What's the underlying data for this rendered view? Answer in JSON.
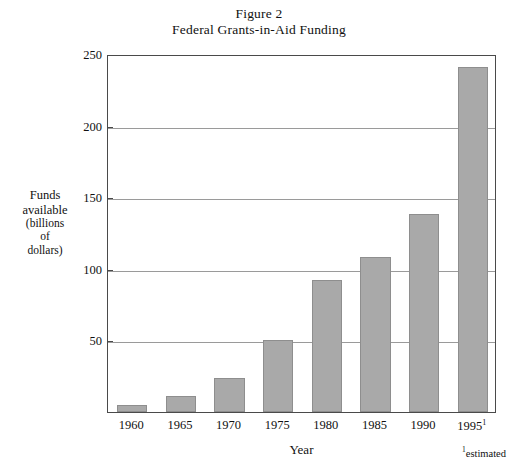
{
  "chart_data": {
    "type": "bar",
    "title": "Figure 2",
    "subtitle": "Federal Grants-in-Aid Funding",
    "categories": [
      "1960",
      "1965",
      "1970",
      "1975",
      "1980",
      "1985",
      "1990",
      "1995"
    ],
    "category_labels": [
      "1960",
      "1965",
      "1970",
      "1975",
      "1980",
      "1985",
      "1990",
      "1995¹"
    ],
    "values": [
      5,
      11,
      24,
      50,
      92,
      108,
      138,
      241
    ],
    "series": [
      {
        "name": "Funds available (billions of dollars)",
        "values": [
          5,
          11,
          24,
          50,
          92,
          108,
          138,
          241
        ]
      }
    ],
    "xlabel": "Year",
    "ylabel": "Funds available (billions of dollars)",
    "ylim": [
      0,
      250
    ],
    "yticks": [
      50,
      100,
      150,
      200,
      250
    ],
    "ytick_labels": [
      "50",
      "100",
      "150",
      "200",
      "250"
    ],
    "grid": true,
    "legend": false,
    "annotations": [
      "¹estimated"
    ],
    "bar_color": "#a9a9a9",
    "bar_border_color": "#8e8e8e",
    "gridline_color": "#9a9a9a",
    "frame_color": "#4a4a4a"
  },
  "title": {
    "line1": "Figure 2",
    "line2": "Federal Grants-in-Aid Funding"
  },
  "y_axis": {
    "title_lines": [
      "Funds",
      "available",
      "(billions",
      "of",
      "dollars)"
    ],
    "ticks": [
      "250",
      "200",
      "150",
      "100",
      "50"
    ]
  },
  "x_axis": {
    "title": "Year",
    "ticks": [
      "1960",
      "1965",
      "1970",
      "1975",
      "1980",
      "1985",
      "1990",
      "1995"
    ],
    "estimated_marker": "1"
  },
  "footnote": {
    "marker": "1",
    "text": "estimated"
  }
}
